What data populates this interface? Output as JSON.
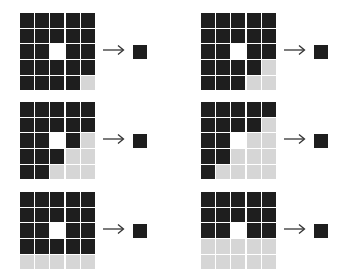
{
  "diagram": {
    "colors": {
      "dark": "#1e1e1e",
      "white": "#ffffff",
      "light": "#d6d6d6",
      "output": "#1f1f1f"
    },
    "panels": [
      {
        "id": "top-left",
        "x": 20,
        "y": 13,
        "output": "dark",
        "rows": [
          "DDDDD",
          "DDDDD",
          "DDWDD",
          "DDDDD",
          "DDDDL"
        ]
      },
      {
        "id": "top-right",
        "x": 201,
        "y": 13,
        "output": "dark",
        "rows": [
          "DDDDD",
          "DDDDD",
          "DDWDD",
          "DDDDL",
          "DDDLL"
        ]
      },
      {
        "id": "middle-left",
        "x": 20,
        "y": 102,
        "output": "dark",
        "rows": [
          "DDDDD",
          "DDDDD",
          "DDWDL",
          "DDDLL",
          "DDLLL"
        ]
      },
      {
        "id": "middle-right",
        "x": 201,
        "y": 102,
        "output": "dark",
        "rows": [
          "DDDDD",
          "DDDDL",
          "DDWLL",
          "DDLLL",
          "DLLLL"
        ]
      },
      {
        "id": "bottom-left",
        "x": 20,
        "y": 192,
        "output": "dark",
        "rows": [
          "DDDDD",
          "DDDDD",
          "DDWDD",
          "DDDDD",
          "LLLLL"
        ]
      },
      {
        "id": "bottom-right",
        "x": 201,
        "y": 192,
        "output": "dark",
        "rows": [
          "DDDDD",
          "DDDDD",
          "DDWDD",
          "LLLLL",
          "LLLLL"
        ]
      }
    ],
    "arrow_glyph": "arrow-right"
  }
}
